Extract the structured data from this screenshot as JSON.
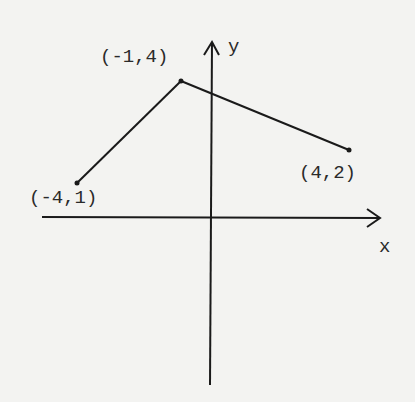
{
  "diagram": {
    "type": "coordinate-plane-polyline",
    "axes": {
      "x_label": "x",
      "y_label": "y"
    },
    "points": [
      {
        "label": "(-4,1)",
        "x": -4,
        "y": 1
      },
      {
        "label": "(-1,4)",
        "x": -1,
        "y": 4
      },
      {
        "label": "(4,2)",
        "x": 4,
        "y": 2
      }
    ],
    "colors": {
      "background": "#f3f3f1",
      "ink": "#1a1a1a"
    }
  }
}
